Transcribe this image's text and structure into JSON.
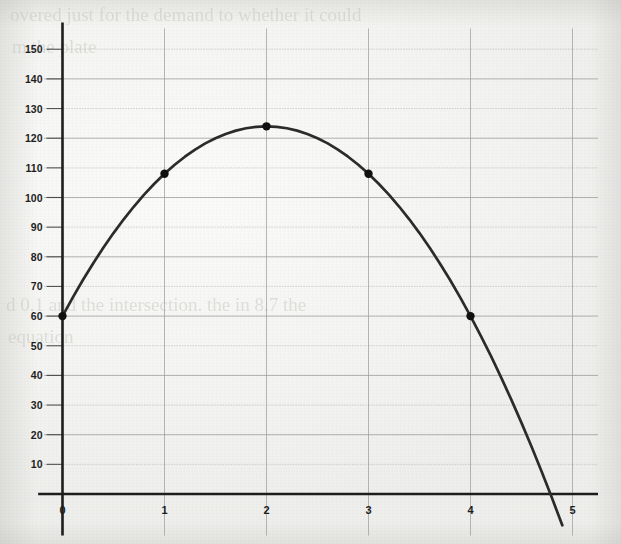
{
  "page": {
    "background_color": "#f4f4f2",
    "ghost_text": {
      "line1": "overed just for the demand to whether it could",
      "line2": "m the plate",
      "line3": "d 0.1 and the intersection. the in 8.7 the",
      "line4": "equation"
    }
  },
  "chart_data": {
    "type": "line",
    "title": "",
    "subtitle": "",
    "xlabel": "",
    "ylabel": "",
    "xlim": [
      -0.18,
      5.25
    ],
    "ylim": [
      -12,
      157
    ],
    "xticks": [
      0,
      1,
      2,
      3,
      4,
      5
    ],
    "xtick_labels": [
      "0",
      "1",
      "2",
      "3",
      "4",
      "5"
    ],
    "yticks": [
      10,
      20,
      30,
      40,
      50,
      60,
      70,
      80,
      90,
      100,
      110,
      120,
      130,
      140,
      150
    ],
    "ytick_labels": [
      "10",
      "20",
      "30",
      "40",
      "50",
      "60",
      "70",
      "80",
      "90",
      "100",
      "110",
      "120",
      "130",
      "140",
      "150"
    ],
    "grid": true,
    "grid_color": "#9a9a9a",
    "axis_color": "#1d1d1d",
    "curve_color": "#2b2b2b",
    "marker_color": "#111111",
    "legend": null,
    "legend_position": "none",
    "equation": "y = -16x^2 + 64x + 60",
    "vertex": [
      2,
      124
    ],
    "x_intercept": 4.775,
    "series": [
      {
        "name": "parabola",
        "marked_points": {
          "x": [
            0,
            1,
            2,
            3,
            4
          ],
          "y": [
            60,
            108,
            124,
            108,
            60
          ]
        },
        "curve": {
          "x": [
            0,
            0.1,
            0.2,
            0.3,
            0.4,
            0.5,
            0.6,
            0.7,
            0.8,
            0.9,
            1,
            1.1,
            1.2,
            1.3,
            1.4,
            1.5,
            1.6,
            1.7,
            1.8,
            1.9,
            2,
            2.1,
            2.2,
            2.3,
            2.4,
            2.5,
            2.6,
            2.7,
            2.8,
            2.9,
            3,
            3.1,
            3.2,
            3.3,
            3.4,
            3.5,
            3.6,
            3.7,
            3.8,
            3.9,
            4,
            4.1,
            4.2,
            4.3,
            4.4,
            4.5,
            4.6,
            4.7,
            4.8,
            4.9
          ],
          "y": [
            60,
            66.24,
            72.16,
            77.76,
            83.04,
            88,
            92.64,
            96.96,
            100.96,
            104.64,
            108,
            111.04,
            113.76,
            116.16,
            118.24,
            120,
            121.44,
            122.56,
            123.36,
            123.84,
            124,
            123.84,
            123.36,
            122.56,
            121.44,
            120,
            118.24,
            116.16,
            113.76,
            111.04,
            108,
            104.64,
            100.96,
            96.96,
            92.64,
            88,
            83.04,
            77.76,
            72.16,
            66.24,
            60,
            53.44,
            46.56,
            39.36,
            31.84,
            24,
            15.84,
            7.36,
            -1.44,
            -10.56
          ]
        }
      }
    ]
  }
}
